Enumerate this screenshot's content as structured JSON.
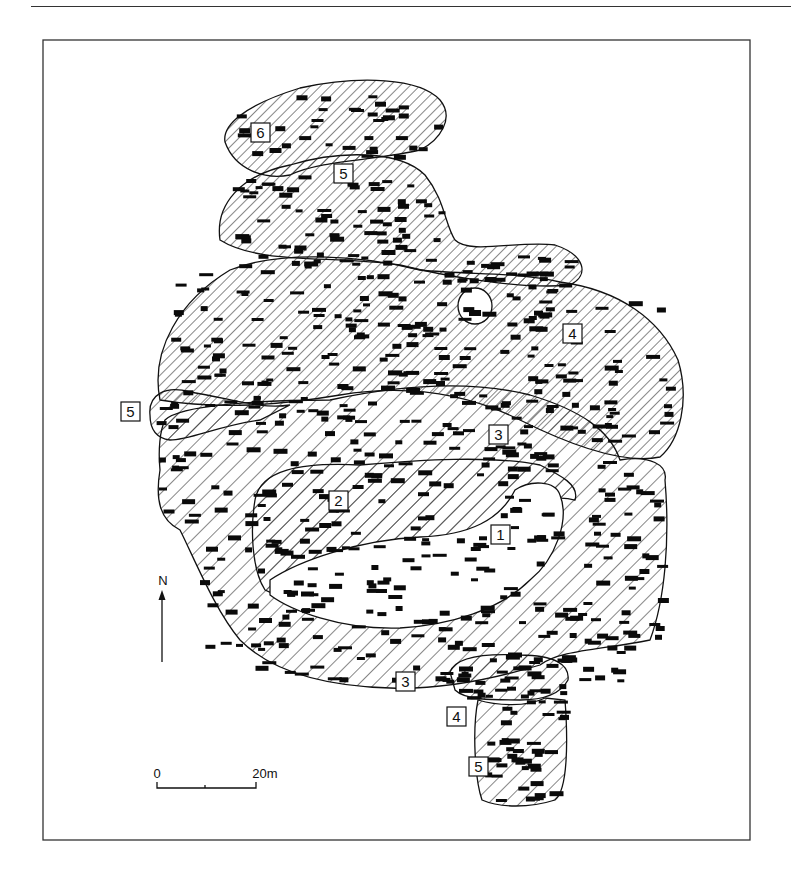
{
  "figure": {
    "type": "site plan",
    "zone_labels": [
      {
        "id": "zone-1",
        "text": "1"
      },
      {
        "id": "zone-2",
        "text": "2"
      },
      {
        "id": "zone-3-upper",
        "text": "3"
      },
      {
        "id": "zone-3-lower",
        "text": "3"
      },
      {
        "id": "zone-4-upper",
        "text": "4"
      },
      {
        "id": "zone-4-lower",
        "text": "4"
      },
      {
        "id": "zone-5-north",
        "text": "5"
      },
      {
        "id": "zone-5-west",
        "text": "5"
      },
      {
        "id": "zone-5-south",
        "text": "5"
      },
      {
        "id": "zone-6",
        "text": "6"
      }
    ],
    "north_arrow": {
      "label": "N"
    },
    "scale_bar": {
      "start_label": "0",
      "end_label": "20m",
      "length_m": 20
    },
    "colors": {
      "ink": "#111111",
      "hatch": "#222222",
      "paper": "#ffffff"
    }
  }
}
